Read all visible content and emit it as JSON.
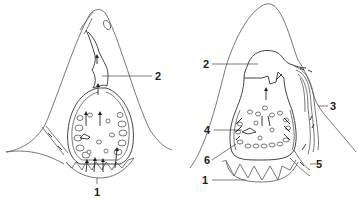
{
  "diagram": {
    "type": "anatomical-cross-section",
    "panels": [
      {
        "id": "left",
        "labels": [
          {
            "text": "1",
            "x": 97,
            "y": 194
          },
          {
            "text": "2",
            "x": 157,
            "y": 80
          }
        ]
      },
      {
        "id": "right",
        "labels": [
          {
            "text": "1",
            "x": 206,
            "y": 184
          },
          {
            "text": "2",
            "x": 202,
            "y": 68
          },
          {
            "text": "3",
            "x": 331,
            "y": 110
          },
          {
            "text": "4",
            "x": 208,
            "y": 134
          },
          {
            "text": "5",
            "x": 317,
            "y": 168
          },
          {
            "text": "6",
            "x": 205,
            "y": 164
          }
        ]
      }
    ]
  },
  "colors": {
    "line": "#555555",
    "text": "#222222",
    "background": "#ffffff"
  }
}
